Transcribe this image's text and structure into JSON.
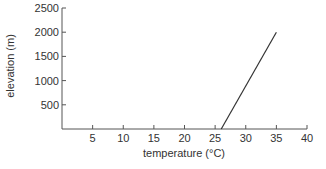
{
  "chart_data": {
    "type": "line",
    "title": "",
    "xlabel": "temperature (°C)",
    "ylabel": "elevation (m)",
    "xlim": [
      0,
      40
    ],
    "ylim": [
      0,
      2500
    ],
    "xticks": [
      5,
      10,
      15,
      20,
      25,
      30,
      35,
      40
    ],
    "yticks": [
      500,
      1000,
      1500,
      2000,
      2500
    ],
    "grid": false,
    "legend": null,
    "series": [
      {
        "name": "elevation vs temperature",
        "x": [
          26,
          35
        ],
        "y": [
          0,
          2000
        ]
      }
    ]
  },
  "labels": {
    "x_title": "temperature (°C)",
    "y_title": "elevation (m)",
    "x_ticks": [
      "5",
      "10",
      "15",
      "20",
      "25",
      "30",
      "35",
      "40"
    ],
    "y_ticks": [
      "500",
      "1000",
      "1500",
      "2000",
      "2500"
    ]
  }
}
